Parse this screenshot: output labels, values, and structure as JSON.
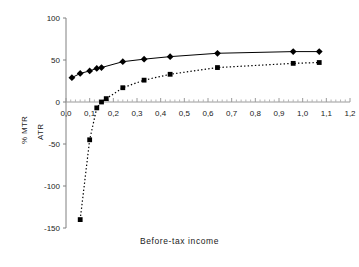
{
  "chart_data": {
    "type": "line",
    "title": "",
    "xlabel": "Before-tax income",
    "ylabel": "% MTR ATR",
    "ylabel_lines": [
      "% MTR",
      "ATR"
    ],
    "xlim": [
      0.0,
      1.2
    ],
    "ylim": [
      -150,
      100
    ],
    "grid": false,
    "legend": "none",
    "xticks": [
      0.0,
      0.1,
      0.2,
      0.3,
      0.4,
      0.5,
      0.6,
      0.7,
      0.8,
      0.9,
      1.0,
      1.1,
      1.2
    ],
    "xticklabels": [
      "0,0",
      "0,1",
      "0,2",
      "0,3",
      "0,4",
      "0,5",
      "0,6",
      "0,7",
      "0,8",
      "0,9",
      "1,0",
      "1,1",
      "1,2"
    ],
    "yticks": [
      100,
      50,
      0,
      -50,
      -100,
      -150
    ],
    "yticklabels": [
      "100",
      "50",
      "0",
      "-50",
      "-100",
      "-150"
    ],
    "series": [
      {
        "name": "MTR",
        "marker": "diamond",
        "linestyle": "solid",
        "color": "#000000",
        "x": [
          0.025,
          0.06,
          0.1,
          0.13,
          0.15,
          0.24,
          0.33,
          0.44,
          0.64,
          0.96,
          1.07
        ],
        "y": [
          29,
          34,
          37,
          40,
          41,
          48,
          51,
          54,
          58,
          60,
          60
        ]
      },
      {
        "name": "ATR",
        "marker": "square",
        "linestyle": "dotted",
        "color": "#000000",
        "x": [
          0.06,
          0.1,
          0.13,
          0.15,
          0.17,
          0.24,
          0.33,
          0.44,
          0.64,
          0.96,
          1.07
        ],
        "y": [
          -140,
          -45,
          -7,
          0,
          4,
          17,
          26,
          33,
          41,
          46,
          47
        ]
      }
    ]
  },
  "axis": {
    "xtitle": "Before-tax income",
    "ylabel_top": "% MTR",
    "ylabel_bottom": "ATR"
  }
}
